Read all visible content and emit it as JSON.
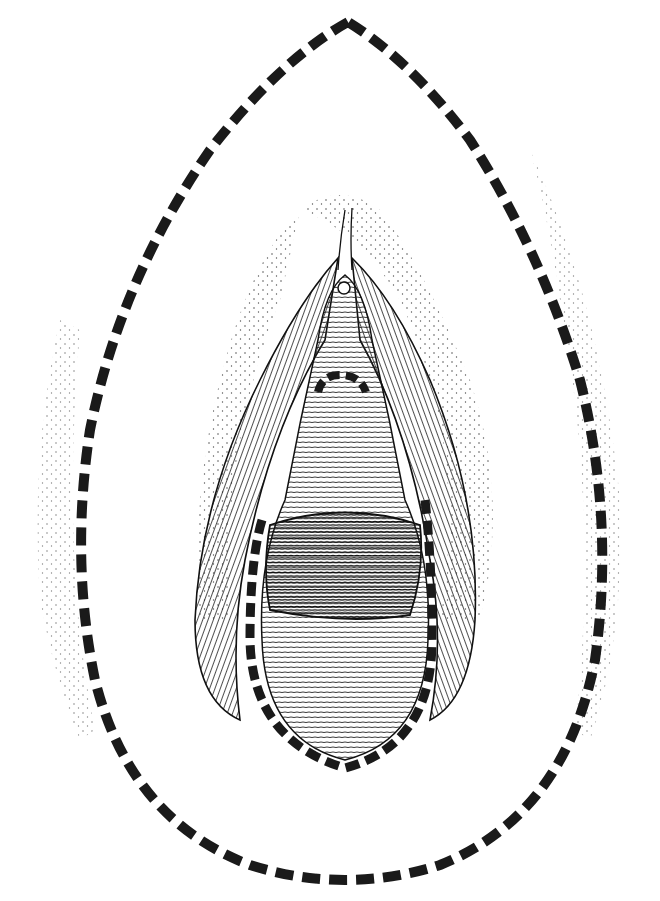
{
  "figure": {
    "kind": "anatomical line illustration",
    "background": "#ffffff",
    "ink": "#1a1a1a",
    "outer_outline": {
      "style": "dashed",
      "shape": "teardrop",
      "apex": [
        348,
        22
      ],
      "bottom": [
        348,
        880
      ]
    },
    "inner_outline": {
      "style": "dashed",
      "shape": "U",
      "top_left": [
        255,
        520
      ],
      "top_right": [
        430,
        520
      ],
      "bottom": [
        345,
        768
      ]
    },
    "small_arc": {
      "style": "dashed",
      "center": [
        340,
        380
      ]
    },
    "labels": []
  }
}
